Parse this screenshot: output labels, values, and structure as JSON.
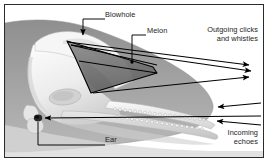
{
  "figure": {
    "border_color": "#2b2b2b",
    "background_color": "#ffffff",
    "text_color": "#1c1c1c",
    "line_color": "#000000",
    "body_silhouette_color": "#9a9a9a",
    "melon_color": "#777777",
    "skull_color": "#f2f2f2"
  },
  "labels": {
    "blowhole": "Blowhole",
    "melon": "Melon",
    "ear": "Ear",
    "outgoing_line1": "Outgoing clicks",
    "outgoing_line2": "and whistles",
    "incoming_line1": "Incoming",
    "incoming_line2": "echoes"
  },
  "annotations": {
    "outgoing_arrow_count": 3,
    "incoming_arrow_count": 3,
    "outgoing_direction": "right",
    "incoming_direction": "left"
  }
}
